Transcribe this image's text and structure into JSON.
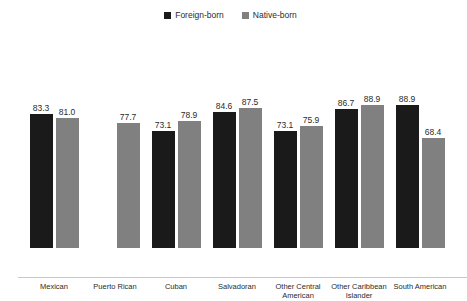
{
  "chart_data": {
    "type": "bar",
    "title": "",
    "subtitle": "",
    "xlabel": "",
    "ylabel": "",
    "ylim": [
      0,
      100
    ],
    "grid": false,
    "legend_position": "top-center",
    "categories": [
      "Mexican",
      "Puerto Rican",
      "Cuban",
      "Salvadoran",
      "Other Central American",
      "Other Caribbean Islander",
      "South American"
    ],
    "series": [
      {
        "name": "Foreign-born",
        "color": "#1a1a1a",
        "values": [
          83.3,
          null,
          73.1,
          84.6,
          73.1,
          86.7,
          88.9
        ]
      },
      {
        "name": "Native-born",
        "color": "#808080",
        "values": [
          81.0,
          77.7,
          78.9,
          87.5,
          75.9,
          88.9,
          68.4
        ]
      }
    ]
  },
  "legend": {
    "entries": [
      {
        "label": "Foreign-born",
        "color": "#1a1a1a",
        "marker": "square-marker"
      },
      {
        "label": "Native-born",
        "color": "#808080",
        "marker": "square-marker"
      }
    ]
  },
  "axis": {
    "category_labels": [
      "Mexican",
      "Puerto Rican",
      "Cuban",
      "Salvadoran",
      "Other Central\nAmerican",
      "Other Caribbean\nIslander",
      "South American"
    ]
  },
  "labels": {
    "mexican_foreign": "83.3",
    "mexican_native": "81.0",
    "puerto_rican_native": "77.7",
    "cuban_foreign": "73.1",
    "cuban_native": "78.9",
    "salvadoran_foreign": "84.6",
    "salvadoran_native": "87.5",
    "other_central_american_foreign": "73.1",
    "other_central_american_native": "75.9",
    "other_caribbean_islander_foreign": "86.7",
    "other_caribbean_islander_native": "88.9",
    "south_american_foreign": "88.9",
    "south_american_native": "68.4"
  }
}
